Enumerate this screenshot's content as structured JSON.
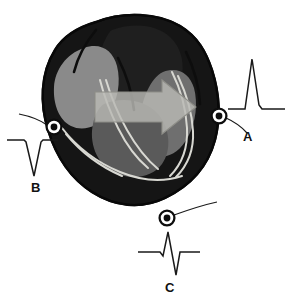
{
  "figure": {
    "background_color": "#ffffff",
    "width": 289,
    "height": 308
  },
  "heart": {
    "name": "heart-cross-section",
    "myocardium_color": "#151515",
    "outline_color": "#0c0c0c",
    "chambers": [
      {
        "name": "left-ventricle-cavity",
        "label": "left ventricle cavity",
        "fill": "#8a8a8a"
      },
      {
        "name": "right-atrium-cavity",
        "label": "right atrium cavity",
        "fill": "#1f1f1f"
      },
      {
        "name": "right-ventricle-cavity",
        "label": "right ventricle cavity",
        "fill": "#6f6f6f"
      },
      {
        "name": "septal-cavity",
        "label": "interventricular septum region",
        "fill": "#5a5a5a"
      }
    ],
    "conduction_fibers": {
      "name": "purkinje-fibers",
      "label": "Purkinje conduction fibers",
      "stroke": "#d8d8d2"
    }
  },
  "vector_arrow": {
    "name": "depolarization-vector-arrow",
    "label": "depolarization wavefront vector",
    "direction": "right",
    "fill": "#b9b9b4",
    "stroke": "#8e8e88",
    "opacity": 0.82
  },
  "electrodes": [
    {
      "id": "A",
      "label": "A",
      "name": "electrode-a",
      "position": "right lateral, facing the advancing vector",
      "ring_color": "#0d0d0d",
      "center_color": "#0d0d0d",
      "cx": 219,
      "cy": 116
    },
    {
      "id": "B",
      "label": "B",
      "name": "electrode-b",
      "position": "left lateral, vector receding",
      "ring_color": "#0d0d0d",
      "center_color": "#0d0d0d",
      "cx": 54,
      "cy": 127
    },
    {
      "id": "C",
      "label": "C",
      "name": "electrode-c",
      "position": "inferior apex, perpendicular to vector",
      "ring_color": "#0d0d0d",
      "center_color": "#0d0d0d",
      "cx": 167,
      "cy": 218
    }
  ],
  "traces": [
    {
      "id": "A",
      "name": "ecg-trace-a",
      "label": "A",
      "morphology": "tall positive R wave",
      "deflection": "positive",
      "stroke": "#1a1a1a",
      "baseline_y": 109,
      "peak_y": 59,
      "amplitude": 50
    },
    {
      "id": "B",
      "name": "ecg-trace-b",
      "label": "B",
      "morphology": "deep negative QS complex",
      "deflection": "negative",
      "stroke": "#1a1a1a",
      "baseline_y": 140,
      "peak_y": 176,
      "amplitude": -36
    },
    {
      "id": "C",
      "name": "ecg-trace-c",
      "label": "C",
      "morphology": "biphasic RS complex",
      "deflection": "biphasic",
      "stroke": "#1a1a1a",
      "baseline_y": 252,
      "peak_y": 232,
      "trough_y": 275,
      "amplitude": 20
    }
  ],
  "leader_lines": {
    "name": "electrode-leader-lines",
    "stroke": "#1a1a1a",
    "width": 1.2
  }
}
